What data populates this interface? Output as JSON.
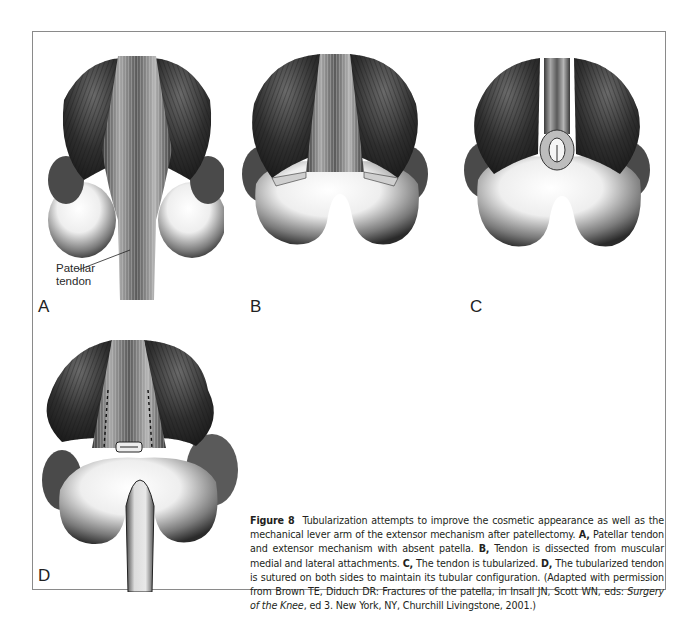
{
  "figure": {
    "number_label": "Figure 8",
    "panels": [
      {
        "id": "A",
        "label": "A",
        "callout": "Patellar tendon",
        "callout_lines": [
          "Patellar",
          "tendon"
        ]
      },
      {
        "id": "B",
        "label": "B"
      },
      {
        "id": "C",
        "label": "C"
      },
      {
        "id": "D",
        "label": "D"
      }
    ],
    "caption": {
      "intro": "Tubularization attempts to improve the cosmetic appearance as well as the mechanical lever arm of the extensor mechanism after patellectomy.",
      "items": [
        {
          "key": "A,",
          "text": "Patellar tendon and extensor mechanism with absent patella."
        },
        {
          "key": "B,",
          "text": "Tendon is dissected from muscular medial and lateral attachments."
        },
        {
          "key": "C,",
          "text": "The tendon is tubularized."
        },
        {
          "key": "D,",
          "text": "The tubularized tendon is sutured on both sides to maintain its tubular configuration."
        }
      ],
      "credit_pre": "(Adapted with permission from Brown TE, Diduch DR: Fractures of the patella, in Insall JN, Scott WN, eds:",
      "credit_book": "Surgery of the Knee",
      "credit_post": ", ed 3. New York, NY, Churchill Livingstone, 2001.)"
    }
  },
  "colors": {
    "border": "#8a8a8a",
    "muscle_dark": "#2b2b2b",
    "muscle_mid": "#555555",
    "bone_light": "#f2f2f2",
    "bone_shadow": "#3a3a3a",
    "tendon": "#9a9a9a"
  }
}
